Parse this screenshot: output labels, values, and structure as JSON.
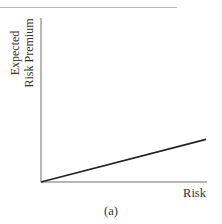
{
  "chart_data": {
    "type": "line",
    "title": "",
    "caption": "(a)",
    "xlabel": "Risk",
    "ylabel": "Expected Risk Premium",
    "ylabel_lines": [
      "Expected",
      "Risk Premium"
    ],
    "grid": false,
    "legend": null,
    "x": [
      0,
      1
    ],
    "series": [
      {
        "name": "Expected risk premium vs. risk",
        "values": [
          0,
          0.26
        ]
      }
    ],
    "xlim": [
      0,
      1
    ],
    "ylim": [
      0,
      1
    ],
    "note": "Unlabeled axes; straight line rising from origin with shallow positive slope"
  },
  "colors": {
    "axis": "#6e6e6e",
    "line": "#222222",
    "rule": "#b8b8b8"
  }
}
